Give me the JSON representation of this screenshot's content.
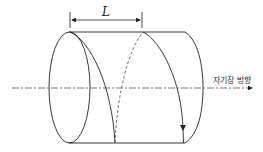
{
  "diagram": {
    "title": "",
    "pitch_label": "L",
    "field_direction_label": "자기장 방향",
    "elements": [
      "cylinder",
      "helical-path-front",
      "helical-path-back-dashed",
      "magnetic-field-axis-arrow",
      "pitch-dimension-arrow"
    ],
    "colors": {
      "line": "#222222",
      "dashed": "#555555",
      "background": "#ffffff"
    }
  }
}
